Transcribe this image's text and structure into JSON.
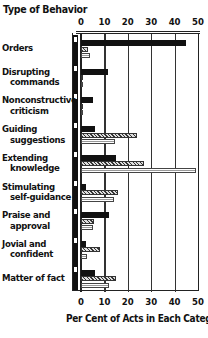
{
  "chart_data": {
    "type": "bar",
    "orientation": "horizontal",
    "title": "Type of Behavior",
    "xlabel": "Per Cent of Acts in Each Category",
    "ylabel": "Type of Behavior",
    "xlim": [
      0,
      50
    ],
    "x_ticks": [
      "0",
      "10",
      "20",
      "30",
      "40",
      "50"
    ],
    "grid": true,
    "legend": "none shown (three series distinguished by solid black, cross-hatched, and light striped fills)",
    "categories": [
      "Orders",
      "Disrupting commands",
      "Nonconstructive criticism",
      "Guiding suggestions",
      "Extending knowledge",
      "Stimulating self-guidance",
      "Praise and approval",
      "Jovial and confident",
      "Matter of fact"
    ],
    "series": [
      {
        "name": "Series 1 (solid black)",
        "values": [
          45,
          11.5,
          5,
          6,
          15,
          2,
          12,
          2,
          6
        ]
      },
      {
        "name": "Series 2 (cross-hatched)",
        "values": [
          3,
          1,
          1,
          24,
          27,
          16,
          5.5,
          8,
          15
        ]
      },
      {
        "name": "Series 3 (light striped)",
        "values": [
          4,
          0.5,
          0.5,
          14.5,
          49,
          14,
          5,
          2.5,
          12
        ]
      }
    ]
  },
  "labels": {
    "title": "Type of Behavior",
    "xlabel": "Per Cent of Acts in Each Category",
    "ticks": [
      "0",
      "10",
      "20",
      "30",
      "40",
      "50"
    ],
    "categories": [
      [
        "Orders",
        ""
      ],
      [
        "Disrupting",
        "commands"
      ],
      [
        "Nonconstructive",
        "criticism"
      ],
      [
        "Guiding",
        "suggestions"
      ],
      [
        "Extending",
        "knowledge"
      ],
      [
        "Stimulating",
        "self-guidance"
      ],
      [
        "Praise and",
        "approval"
      ],
      [
        "Jovial and",
        "confident"
      ],
      [
        "Matter of fact",
        ""
      ]
    ]
  }
}
